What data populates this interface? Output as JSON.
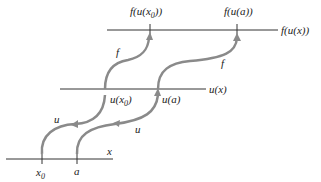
{
  "diagram": {
    "axes": [
      {
        "id": "x-axis",
        "label": "x",
        "points": [
          {
            "label": "x",
            "sub": "0"
          },
          {
            "label": "a",
            "sub": ""
          }
        ]
      },
      {
        "id": "u-axis",
        "label": "u(x)",
        "points": [
          {
            "label": "u(x",
            "sub": "0",
            "close": ")"
          },
          {
            "label": "u(a)",
            "sub": ""
          }
        ]
      },
      {
        "id": "f-axis",
        "label": "f(u(x))",
        "points": [
          {
            "label": "f(u(x",
            "sub": "0",
            "close": "))"
          },
          {
            "label": "f(u(a))",
            "sub": ""
          }
        ]
      }
    ],
    "arrows": [
      {
        "from": "x0",
        "to": "u(x0)",
        "label": "u"
      },
      {
        "from": "a",
        "to": "u(a)",
        "label": "u"
      },
      {
        "from": "u(x0)",
        "to": "f(u(x0))",
        "label": "f"
      },
      {
        "from": "u(a)",
        "to": "f(u(a))",
        "label": "f"
      }
    ],
    "colors": {
      "axis": "#333333",
      "arrow": "#8a8a8a"
    }
  }
}
